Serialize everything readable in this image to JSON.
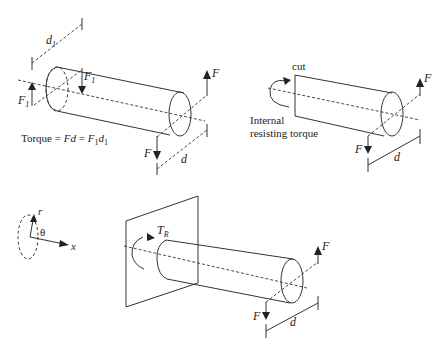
{
  "figure": {
    "panels": [
      {
        "id": "panel-a",
        "labels": {
          "dimension_d1": "d",
          "dimension_d1_sub": "1",
          "force_F1_top": "F",
          "force_F1_top_sub": "1",
          "force_F1_left": "F",
          "force_F1_left_sub": "1",
          "force_F_up": "F",
          "force_F_down": "F",
          "dimension_d": "d",
          "equation_prefix": "Torque = ",
          "equation_Fd": "Fd",
          "equation_eq": " = ",
          "equation_F": "F",
          "equation_F_sub": "1",
          "equation_d": "d",
          "equation_d_sub": "1"
        }
      },
      {
        "id": "panel-b",
        "labels": {
          "cut": "cut",
          "internal_line1": "Internal",
          "internal_line2": "resisting torque",
          "force_F_up": "F",
          "force_F_down": "F",
          "dimension_d": "d"
        }
      },
      {
        "id": "panel-c",
        "labels": {
          "axis_r": "r",
          "axis_theta": "θ",
          "axis_x": "x"
        }
      },
      {
        "id": "panel-d",
        "labels": {
          "torque_T": "T",
          "torque_T_sub": "R",
          "force_F_up": "F",
          "force_F_down": "F",
          "dimension_d": "d"
        }
      }
    ]
  }
}
